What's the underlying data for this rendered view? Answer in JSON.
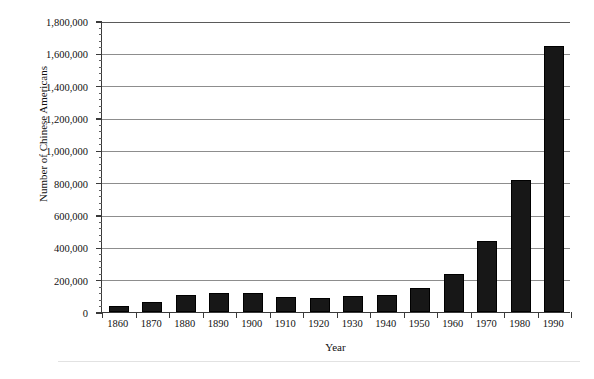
{
  "chart_data": {
    "type": "bar",
    "title": "",
    "xlabel": "Year",
    "ylabel": "Number of Chinese Americans",
    "categories": [
      "1860",
      "1870",
      "1880",
      "1890",
      "1900",
      "1910",
      "1920",
      "1930",
      "1940",
      "1950",
      "1960",
      "1970",
      "1980",
      "1990"
    ],
    "values": [
      35000,
      63000,
      105000,
      120000,
      115000,
      95000,
      85000,
      102000,
      106000,
      150000,
      237000,
      440000,
      818000,
      1645000
    ],
    "ylim": [
      0,
      1800000
    ],
    "ytick_labels": [
      "0",
      "200,000",
      "400,000",
      "600,000",
      "800,000",
      "1,000,000",
      "1,200,000",
      "1,400,000",
      "1,600,000",
      "1,800,000"
    ],
    "ytick_values": [
      0,
      200000,
      400000,
      600000,
      800000,
      1000000,
      1200000,
      1400000,
      1600000,
      1800000
    ],
    "minor_tick_interval": 40000,
    "grid": "horizontal",
    "legend": "none",
    "bar_color": "#171717",
    "grid_color": "#8d8d8d",
    "axis_color": "#3a3a3a"
  }
}
